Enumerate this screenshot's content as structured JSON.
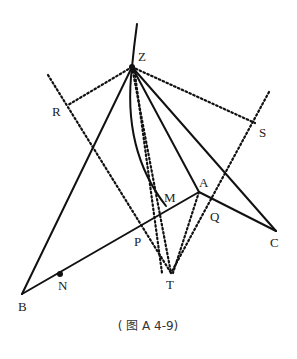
{
  "figure": {
    "caption": "( 图 A 4-9)",
    "labels": {
      "Z": "Z",
      "R": "R",
      "S": "S",
      "A": "A",
      "M": "M",
      "P": "P",
      "Q": "Q",
      "T": "T",
      "B": "B",
      "N": "N",
      "C": "C"
    },
    "points": {
      "Z": [
        132,
        67
      ],
      "R": [
        68,
        105
      ],
      "S": [
        255,
        123
      ],
      "A": [
        199,
        192
      ],
      "M": [
        168,
        210
      ],
      "P": [
        139,
        226
      ],
      "Q": [
        222,
        203
      ],
      "T": [
        171,
        273
      ],
      "B": [
        22,
        294
      ],
      "N": [
        60,
        274
      ],
      "C": [
        276,
        231
      ]
    },
    "solid_segments": [
      "ZB",
      "ZA",
      "ZC",
      "BA",
      "AC",
      "arc ZM",
      "curve above Z"
    ],
    "dotted_segments": [
      "ZR",
      "ZS",
      "ZT",
      "ZP→T",
      "RT",
      "ST",
      "AT"
    ]
  }
}
